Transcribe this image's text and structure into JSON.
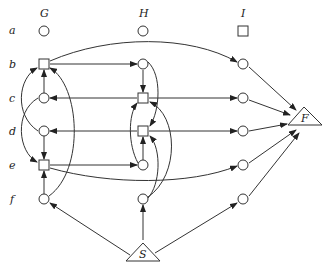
{
  "columns": [
    {
      "label": "G",
      "x": 44
    },
    {
      "label": "H",
      "x": 143
    },
    {
      "label": "I",
      "x": 243
    }
  ],
  "rows": [
    {
      "label": "a",
      "y": 31
    },
    {
      "label": "b",
      "y": 64
    },
    {
      "label": "c",
      "y": 98
    },
    {
      "label": "d",
      "y": 131
    },
    {
      "label": "e",
      "y": 165
    },
    {
      "label": "f",
      "y": 199
    }
  ],
  "nodes": {
    "G": [
      "circle",
      "square",
      "circle",
      "circle",
      "square",
      "circle"
    ],
    "H": [
      "circle",
      "circle",
      "square",
      "square",
      "circle",
      "circle"
    ],
    "I": [
      "square",
      "circle",
      "circle",
      "circle",
      "circle",
      "circle"
    ]
  },
  "terminals": {
    "F": {
      "label": "F"
    },
    "S": {
      "label": "S"
    }
  },
  "colors": {
    "stroke": "#333333",
    "background": "#ffffff"
  }
}
